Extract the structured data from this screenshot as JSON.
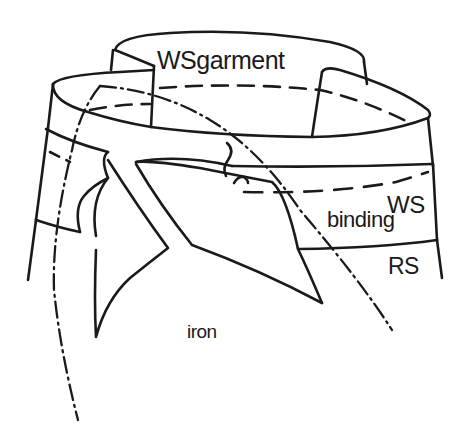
{
  "figure": {
    "type": "sewing-technique-illustration",
    "labels": {
      "ws_garment_ws": "WS",
      "ws_garment_word": "garment",
      "ws_binding": "WS",
      "binding": "binding",
      "rs": "RS",
      "iron": "iron"
    },
    "line_styles": {
      "outline": "solid",
      "stitching": "dashed",
      "fold_guide": "dash-dot"
    },
    "colors": {
      "ink": "#1a1a1a",
      "background": "#ffffff"
    }
  }
}
